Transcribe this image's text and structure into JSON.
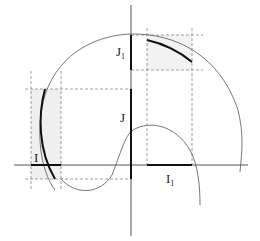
{
  "diagram": {
    "labels": {
      "I": "I",
      "I1_base": "I",
      "I1_sub": "1",
      "J": "J",
      "J1_base": "J",
      "J1_sub": "1"
    },
    "colors": {
      "axis": "#555555",
      "curve": "#666666",
      "highlight": "#111111",
      "dashed": "#888888",
      "shade": "#eeeeee"
    }
  }
}
